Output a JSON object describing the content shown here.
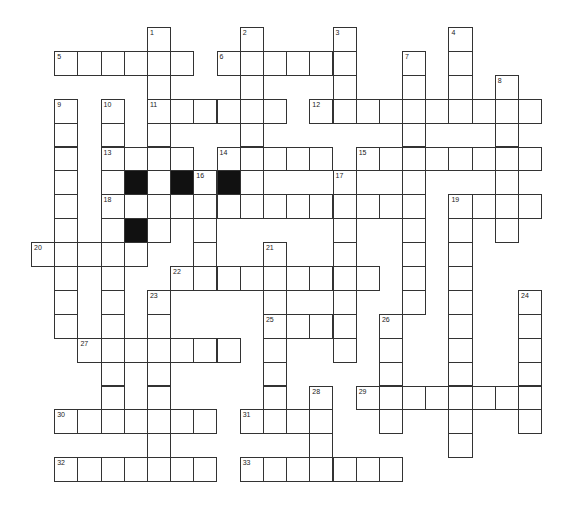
{
  "puzzle": {
    "grid": {
      "origin_x": 31,
      "origin_y": 27,
      "cell_w": 23.19,
      "cell_h": 23.9
    },
    "colors": {
      "line": "#333333",
      "fill": "#ffffff",
      "block": "#111111"
    },
    "entries": [
      {
        "num": "1",
        "dir": "down",
        "col": 5,
        "row": 0,
        "len": 9
      },
      {
        "num": "2",
        "dir": "down",
        "col": 9,
        "row": 0,
        "len": 8
      },
      {
        "num": "3",
        "dir": "down",
        "col": 13,
        "row": 0,
        "len": 4
      },
      {
        "num": "4",
        "dir": "down",
        "col": 18,
        "row": 0,
        "len": 4
      },
      {
        "num": "5",
        "dir": "across",
        "col": 1,
        "row": 1,
        "len": 6
      },
      {
        "num": "6",
        "dir": "across",
        "col": 8,
        "row": 1,
        "len": 6
      },
      {
        "num": "7",
        "dir": "down",
        "col": 16,
        "row": 1,
        "len": 11
      },
      {
        "num": "8",
        "dir": "down",
        "col": 20,
        "row": 2,
        "len": 7
      },
      {
        "num": "9",
        "dir": "down",
        "col": 1,
        "row": 3,
        "len": 10
      },
      {
        "num": "10",
        "dir": "down",
        "col": 3,
        "row": 3,
        "len": 13
      },
      {
        "num": "11",
        "dir": "across",
        "col": 5,
        "row": 3,
        "len": 6
      },
      {
        "num": "12",
        "dir": "across",
        "col": 12,
        "row": 3,
        "len": 10
      },
      {
        "num": "13",
        "dir": "across",
        "col": 3,
        "row": 5,
        "len": 4
      },
      {
        "num": "14",
        "dir": "across",
        "col": 8,
        "row": 5,
        "len": 5
      },
      {
        "num": "15",
        "dir": "across",
        "col": 14,
        "row": 5,
        "len": 8
      },
      {
        "num": "16",
        "dir": "down",
        "col": 7,
        "row": 6,
        "len": 5
      },
      {
        "num": "17",
        "dir": "down",
        "col": 13,
        "row": 6,
        "len": 8
      },
      {
        "num": "18",
        "dir": "across",
        "col": 3,
        "row": 7,
        "len": 14
      },
      {
        "num": "19",
        "dir": "across",
        "col": 18,
        "row": 7,
        "len": 4
      },
      {
        "num": "19",
        "dir": "down",
        "col": 18,
        "row": 7,
        "len": 11
      },
      {
        "num": "20",
        "dir": "across",
        "col": 0,
        "row": 9,
        "len": 5
      },
      {
        "num": "21",
        "dir": "down",
        "col": 10,
        "row": 9,
        "len": 8
      },
      {
        "num": "22",
        "dir": "across",
        "col": 6,
        "row": 10,
        "len": 9
      },
      {
        "num": "23",
        "dir": "down",
        "col": 5,
        "row": 11,
        "len": 8
      },
      {
        "num": "24",
        "dir": "down",
        "col": 21,
        "row": 11,
        "len": 6
      },
      {
        "num": "25",
        "dir": "across",
        "col": 10,
        "row": 12,
        "len": 4
      },
      {
        "num": "26",
        "dir": "down",
        "col": 15,
        "row": 12,
        "len": 5
      },
      {
        "num": "27",
        "dir": "across",
        "col": 2,
        "row": 13,
        "len": 7
      },
      {
        "num": "28",
        "dir": "down",
        "col": 12,
        "row": 15,
        "len": 4
      },
      {
        "num": "29",
        "dir": "across",
        "col": 14,
        "row": 15,
        "len": 8
      },
      {
        "num": "30",
        "dir": "across",
        "col": 1,
        "row": 16,
        "len": 7
      },
      {
        "num": "31",
        "dir": "across",
        "col": 9,
        "row": 16,
        "len": 4
      },
      {
        "num": "32",
        "dir": "across",
        "col": 1,
        "row": 18,
        "len": 7
      },
      {
        "num": "33",
        "dir": "across",
        "col": 9,
        "row": 18,
        "len": 7
      }
    ],
    "blocks": [
      {
        "col": 4,
        "row": 6
      },
      {
        "col": 6,
        "row": 6
      },
      {
        "col": 8,
        "row": 6
      },
      {
        "col": 4,
        "row": 8
      }
    ]
  }
}
